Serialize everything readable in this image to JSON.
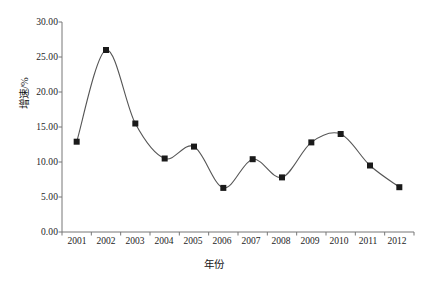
{
  "chart_data": {
    "type": "line",
    "title": "",
    "subtitle": "",
    "xlabel": "年份",
    "ylabel": "增速/%",
    "categories": [
      "2001",
      "2002",
      "2003",
      "2004",
      "2005",
      "2006",
      "2007",
      "2008",
      "2009",
      "2010",
      "2011",
      "2012"
    ],
    "values": [
      12.9,
      26.0,
      15.5,
      10.5,
      12.2,
      6.3,
      10.4,
      7.8,
      12.8,
      14.0,
      9.5,
      6.4
    ],
    "series": [
      {
        "name": "增速/%",
        "values": [
          12.9,
          26.0,
          15.5,
          10.5,
          12.2,
          6.3,
          10.4,
          7.8,
          12.8,
          14.0,
          9.5,
          6.4
        ]
      }
    ],
    "ylim": [
      0,
      30
    ],
    "ytick_labels": [
      "0.00",
      "5.00",
      "10.00",
      "15.00",
      "20.00",
      "25.00",
      "30.00"
    ],
    "ytick_values": [
      0,
      5,
      10,
      15,
      20,
      25,
      30
    ],
    "xtick_labels": [
      "2001",
      "2002",
      "2003",
      "2004",
      "2005",
      "2006",
      "2007",
      "2008",
      "2009",
      "2010",
      "2011",
      "2012"
    ],
    "grid": false,
    "legend": "none",
    "marker": "square",
    "line_color": "#555555",
    "marker_color": "#1a1a1a",
    "axis_color": "#777777",
    "background_color": "#ffffff",
    "smoothing": "spline"
  }
}
